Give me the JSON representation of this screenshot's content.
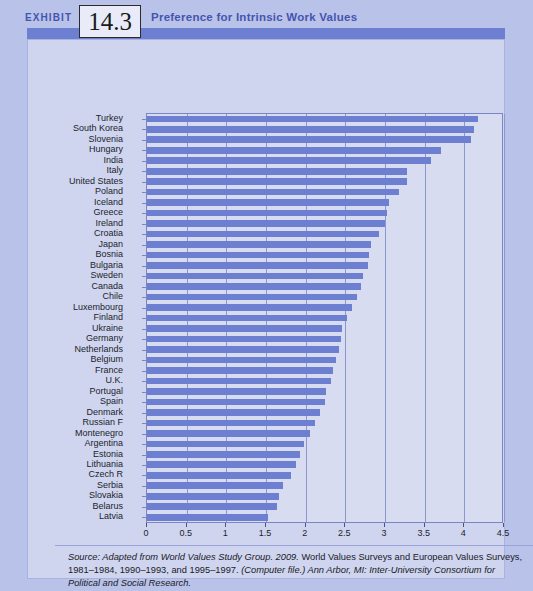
{
  "header": {
    "exhibit_word": "EXHIBIT",
    "exhibit_number": "14.3",
    "title": "Preference for Intrinsic Work Values"
  },
  "source_note": {
    "part_italic_1": "Source: Adapted from World Values Study Group. 2009.",
    "part_plain_1": " World Values Surveys and European Values Surveys, 1981–1984, 1990–1993, and 1995–1997. ",
    "part_italic_2": "(Computer file.) Ann Arbor, MI: Inter-University Consortium for Political and Social Research.",
    "full": "Source: Adapted from World Values Study Group. 2009. World Values Surveys and European Values Surveys, 1981–1984, 1990–1993, and 1995–1997. (Computer file.) Ann Arbor, MI: Inter-University Consortium for Political and Social Research."
  },
  "colors": {
    "bar": "#6d7fd0",
    "page_background": "#b9c2e8",
    "panel_background": "#cfd5ef",
    "plot_background": "#d8dcf0",
    "accent_text": "#4455b0",
    "axis": "#7b85c4"
  },
  "chart_data": {
    "type": "bar",
    "orientation": "horizontal",
    "title": "Preference for Intrinsic Work Values",
    "xlabel": "",
    "ylabel": "",
    "xlim": [
      0,
      4.5
    ],
    "xticks": [
      "0",
      "0.5",
      "1",
      "1.5",
      "2",
      "2.5",
      "3",
      "3.5",
      "4",
      "4.5"
    ],
    "xtick_values": [
      0,
      0.5,
      1,
      1.5,
      2,
      2.5,
      3,
      3.5,
      4,
      4.5
    ],
    "grid": "vertical",
    "legend": "none",
    "categories": [
      "Turkey",
      "South Korea",
      "Slovenia",
      "Hungary",
      "India",
      "Italy",
      "United States",
      "Poland",
      "Iceland",
      "Greece",
      "Ireland",
      "Croatia",
      "Japan",
      "Bosnia",
      "Bulgaria",
      "Sweden",
      "Canada",
      "Chile",
      "Luxembourg",
      "Finland",
      "Ukraine",
      "Germany",
      "Netherlands",
      "Belgium",
      "France",
      "U.K.",
      "Portugal",
      "Spain",
      "Denmark",
      "Russian F",
      "Montenegro",
      "Argentina",
      "Estonia",
      "Lithuania",
      "Czech R",
      "Serbia",
      "Slovakia",
      "Belarus",
      "Latvia"
    ],
    "values": [
      4.17,
      4.12,
      4.08,
      3.7,
      3.58,
      3.28,
      3.28,
      3.18,
      3.05,
      3.03,
      3.0,
      2.93,
      2.82,
      2.8,
      2.78,
      2.72,
      2.7,
      2.65,
      2.58,
      2.52,
      2.46,
      2.45,
      2.42,
      2.38,
      2.35,
      2.32,
      2.26,
      2.24,
      2.18,
      2.12,
      2.05,
      1.98,
      1.93,
      1.88,
      1.82,
      1.71,
      1.67,
      1.64,
      1.53
    ]
  }
}
